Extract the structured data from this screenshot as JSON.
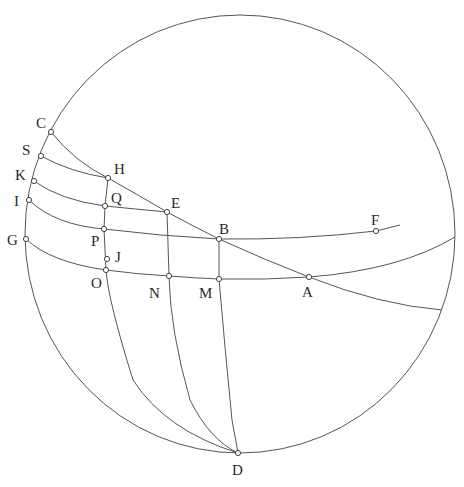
{
  "figure": {
    "type": "spherical-geometry-diagram",
    "colors": {
      "line": "#555555",
      "point_fill": "#ffffff",
      "point_stroke": "#444444",
      "label": "#2a2a2a",
      "background": "#ffffff"
    },
    "sphere_outline": {
      "cx": 240,
      "cy": 234,
      "rx": 215,
      "ry": 219
    },
    "points": [
      {
        "id": "C",
        "label": "C",
        "x": 51,
        "y": 132,
        "lx": 36,
        "ly": 128
      },
      {
        "id": "S",
        "label": "S",
        "x": 41,
        "y": 156,
        "lx": 22,
        "ly": 155
      },
      {
        "id": "K",
        "label": "K",
        "x": 34,
        "y": 181,
        "lx": 15,
        "ly": 180
      },
      {
        "id": "I",
        "label": "I",
        "x": 29,
        "y": 200,
        "lx": 14,
        "ly": 206
      },
      {
        "id": "G",
        "label": "G",
        "x": 26,
        "y": 239,
        "lx": 7,
        "ly": 245
      },
      {
        "id": "H",
        "label": "H",
        "x": 108,
        "y": 178,
        "lx": 114,
        "ly": 174
      },
      {
        "id": "Q",
        "label": "Q",
        "x": 105,
        "y": 206,
        "lx": 111,
        "ly": 203
      },
      {
        "id": "P",
        "label": "P",
        "x": 104,
        "y": 229,
        "lx": 91,
        "ly": 246
      },
      {
        "id": "J",
        "label": "J",
        "x": 107,
        "y": 259,
        "lx": 115,
        "ly": 262
      },
      {
        "id": "O",
        "label": "O",
        "x": 106,
        "y": 270,
        "lx": 91,
        "ly": 288
      },
      {
        "id": "E",
        "label": "E",
        "x": 167,
        "y": 212,
        "lx": 171,
        "ly": 208
      },
      {
        "id": "B",
        "label": "B",
        "x": 219,
        "y": 239,
        "lx": 219,
        "ly": 234
      },
      {
        "id": "N",
        "label": "N",
        "x": 169,
        "y": 276,
        "lx": 149,
        "ly": 298
      },
      {
        "id": "M",
        "label": "M",
        "x": 219,
        "y": 279,
        "lx": 199,
        "ly": 298
      },
      {
        "id": "A",
        "label": "A",
        "x": 309,
        "y": 277,
        "lx": 302,
        "ly": 297
      },
      {
        "id": "F",
        "label": "F",
        "x": 376,
        "y": 231,
        "lx": 371,
        "ly": 225
      },
      {
        "id": "D",
        "label": "D",
        "x": 238,
        "y": 453,
        "lx": 232,
        "ly": 475
      }
    ],
    "arcs": [
      {
        "id": "arc-CHEBA",
        "through": [
          "C",
          "H",
          "E",
          "B",
          "A"
        ],
        "d": "M51,132 Q75,162 108,178 Q140,196 167,212 Q193,226 219,239 Q265,260 309,277 Q380,305 442,310"
      },
      {
        "id": "arc-SH",
        "through": [
          "S",
          "H"
        ],
        "d": "M41,156 Q70,172 108,178"
      },
      {
        "id": "arc-KQE",
        "through": [
          "K",
          "Q",
          "E"
        ],
        "d": "M34,181 Q60,200 105,206 Q135,209 167,212"
      },
      {
        "id": "arc-IPBF",
        "through": [
          "I",
          "P",
          "B",
          "F"
        ],
        "d": "M29,200 Q55,225 104,229 Q160,236 219,239 Q300,240 376,231 L400,225"
      },
      {
        "id": "arc-GONMA",
        "through": [
          "G",
          "O",
          "N",
          "M",
          "A"
        ],
        "d": "M26,239 Q50,262 106,270 Q135,274 169,276 Q195,278 219,279 Q265,280 309,277 Q400,270 455,237"
      },
      {
        "id": "meridian-HQPOD",
        "through": [
          "H",
          "Q",
          "P",
          "O",
          "D"
        ],
        "d": "M108,178 L105,206 L104,229 L106,270 Q108,300 133,380 Q165,430 238,453"
      },
      {
        "id": "meridian-END",
        "through": [
          "E",
          "N",
          "D"
        ],
        "d": "M167,212 L169,276 Q170,330 190,400 Q210,440 238,453"
      },
      {
        "id": "meridian-BMD",
        "through": [
          "B",
          "M",
          "D"
        ],
        "d": "M219,239 L219,279 Q225,350 232,420 L238,453"
      }
    ]
  }
}
